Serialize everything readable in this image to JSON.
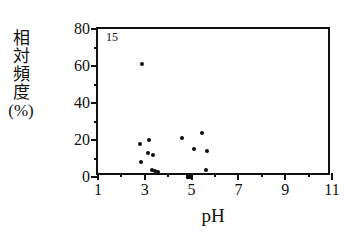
{
  "chart_data": {
    "type": "scatter",
    "title": "",
    "xlabel": "pH",
    "ylabel": "相対頻度(%)",
    "ylabel_chars": [
      "相",
      "対",
      "頻",
      "度",
      "(%)"
    ],
    "annotation": "15",
    "xlim": [
      1,
      11
    ],
    "ylim": [
      0,
      80
    ],
    "x_ticks_major": [
      1,
      3,
      5,
      7,
      9,
      11
    ],
    "x_ticks_minor": [
      2,
      4,
      6,
      8,
      10
    ],
    "x_tick_labels": [
      "1",
      "3",
      "5",
      "7",
      "9",
      "11"
    ],
    "y_ticks_major": [
      0,
      20,
      40,
      60,
      80
    ],
    "y_ticks_minor": [
      10,
      30,
      50,
      70
    ],
    "y_tick_labels": [
      "0",
      "20",
      "40",
      "60",
      "80"
    ],
    "grid": false,
    "legend": null,
    "marker_color": "#0d0d0d",
    "axis_color": "#111111",
    "points": [
      {
        "x": 2.9,
        "y": 61,
        "emphasis": false
      },
      {
        "x": 2.8,
        "y": 18,
        "emphasis": false
      },
      {
        "x": 2.85,
        "y": 8,
        "emphasis": false
      },
      {
        "x": 3.2,
        "y": 20,
        "emphasis": false
      },
      {
        "x": 3.15,
        "y": 13,
        "emphasis": false
      },
      {
        "x": 3.35,
        "y": 12,
        "emphasis": false
      },
      {
        "x": 3.3,
        "y": 4,
        "emphasis": false
      },
      {
        "x": 3.45,
        "y": 3,
        "emphasis": false
      },
      {
        "x": 3.55,
        "y": 2.5,
        "emphasis": false
      },
      {
        "x": 4.6,
        "y": 21,
        "emphasis": false
      },
      {
        "x": 5.1,
        "y": 15,
        "emphasis": false
      },
      {
        "x": 4.9,
        "y": 0.5,
        "emphasis": true
      },
      {
        "x": 5.45,
        "y": 24,
        "emphasis": false
      },
      {
        "x": 5.65,
        "y": 14,
        "emphasis": false
      },
      {
        "x": 5.6,
        "y": 4,
        "emphasis": false
      }
    ]
  }
}
